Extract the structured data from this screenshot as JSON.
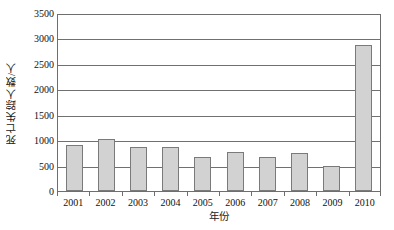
{
  "chart_data": {
    "type": "bar",
    "title": "",
    "xlabel": "年份",
    "ylabel": "死亡失踪人数/人",
    "categories": [
      "2001",
      "2002",
      "2003",
      "2004",
      "2005",
      "2006",
      "2007",
      "2008",
      "2009",
      "2010"
    ],
    "values": [
      920,
      1030,
      880,
      870,
      675,
      770,
      675,
      765,
      490,
      2910
    ],
    "ylim": [
      0,
      3500
    ],
    "ytick_labels": [
      "0",
      "500",
      "1000",
      "1500",
      "2000",
      "2500",
      "3000",
      "3500"
    ],
    "ytick_values": [
      0,
      500,
      1000,
      1500,
      2000,
      2500,
      3000,
      3500
    ],
    "grid": true,
    "legend": "none",
    "bar_fill_color": "#d2d2d2",
    "bar_border_color": "#7a7a7a",
    "axis_color": "#6e6e6e",
    "gridline_color": "#707070",
    "background_color": "#ffffff"
  }
}
